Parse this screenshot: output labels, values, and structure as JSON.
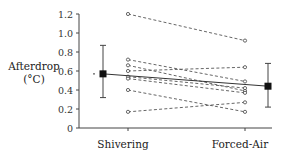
{
  "chart_data": {
    "type": "line",
    "title": "",
    "xlabel": "",
    "ylabel": "Afterdrop (°C)",
    "ylabel_lines": [
      "Afterdrop",
      "(°C)"
    ],
    "categories": [
      "Shivering",
      "Forced-Air"
    ],
    "ylim": [
      0,
      1.2
    ],
    "yticks": [
      0,
      0.2,
      0.4,
      0.6,
      0.8,
      1.0,
      1.2
    ],
    "ytick_labels": [
      "0",
      "0.2",
      "0.4",
      "0.6",
      "0.8",
      "1.0",
      "1.2"
    ],
    "grid": false,
    "legend": null,
    "series": [
      {
        "name": "Subject 1",
        "values": [
          1.2,
          0.92
        ],
        "style": "dashed",
        "marker": "open-circle"
      },
      {
        "name": "Subject 2",
        "values": [
          0.72,
          0.49
        ],
        "style": "dashed",
        "marker": "open-circle"
      },
      {
        "name": "Subject 3",
        "values": [
          0.66,
          0.39
        ],
        "style": "dashed",
        "marker": "open-circle"
      },
      {
        "name": "Subject 4",
        "values": [
          0.6,
          0.64
        ],
        "style": "dashed",
        "marker": "open-circle"
      },
      {
        "name": "Subject 5",
        "values": [
          0.54,
          0.42
        ],
        "style": "dashed",
        "marker": "open-circle"
      },
      {
        "name": "Subject 6",
        "values": [
          0.52,
          0.37
        ],
        "style": "dashed",
        "marker": "open-circle"
      },
      {
        "name": "Subject 7",
        "values": [
          0.4,
          0.17
        ],
        "style": "dashed",
        "marker": "open-circle"
      },
      {
        "name": "Subject 8",
        "values": [
          0.17,
          0.27
        ],
        "style": "dashed",
        "marker": "open-circle"
      }
    ],
    "mean": {
      "name": "Mean ± SD",
      "values": [
        0.57,
        0.44
      ],
      "error_low": [
        0.32,
        0.22
      ],
      "error_high": [
        0.87,
        0.68
      ],
      "style": "solid",
      "marker": "filled-square"
    },
    "annotations": [
      {
        "text": "•",
        "near": "Shivering mean",
        "note": "small dot left of mean marker"
      }
    ]
  }
}
